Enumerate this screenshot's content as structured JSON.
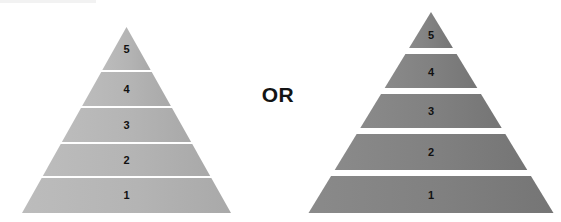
{
  "canvas": {
    "width": 561,
    "height": 222,
    "background": "#ffffff"
  },
  "connector": {
    "label": "OR",
    "color": "#141414"
  },
  "figures": [
    {
      "id": "pyramid-contiguous",
      "name": "left-pyramid",
      "style": "contiguous",
      "fill": "#b4b4b4",
      "fill_light": "#bcbcbc",
      "fill_dark": "#a9a9a9",
      "separator_color": "#ffffff",
      "separator_thickness": 2,
      "apex": {
        "x": 126.5,
        "y": 27
      },
      "base": {
        "left_x": 22,
        "right_x": 231,
        "y": 213
      },
      "tiers": [
        {
          "label": "5",
          "top_y": 27,
          "bottom_y": 70,
          "label_y": 50
        },
        {
          "label": "4",
          "top_y": 72,
          "bottom_y": 106,
          "label_y": 90
        },
        {
          "label": "3",
          "top_y": 108,
          "bottom_y": 142,
          "label_y": 126
        },
        {
          "label": "2",
          "top_y": 144,
          "bottom_y": 176,
          "label_y": 161
        },
        {
          "label": "1",
          "top_y": 178,
          "bottom_y": 213,
          "label_y": 196
        }
      ]
    },
    {
      "id": "pyramid-segmented",
      "name": "right-pyramid",
      "style": "segmented",
      "fill": "#808080",
      "fill_light": "#8a8a8a",
      "fill_dark": "#757575",
      "separator_color": "#ffffff",
      "gap": 6,
      "apex": {
        "x": 431,
        "y": 12
      },
      "base": {
        "left_x": 308,
        "right_x": 553,
        "y": 213
      },
      "tiers": [
        {
          "label": "5",
          "top_y": 12,
          "bottom_y": 48,
          "label_y": 36
        },
        {
          "label": "4",
          "top_y": 54,
          "bottom_y": 88,
          "label_y": 73
        },
        {
          "label": "3",
          "top_y": 94,
          "bottom_y": 128,
          "label_y": 112
        },
        {
          "label": "2",
          "top_y": 134,
          "bottom_y": 170,
          "label_y": 153
        },
        {
          "label": "1",
          "top_y": 176,
          "bottom_y": 213,
          "label_y": 196
        }
      ]
    }
  ],
  "chart_data": {
    "type": "diagram",
    "title": "",
    "subtitle": "",
    "comparison_operator": "OR",
    "options": [
      {
        "name": "left-pyramid",
        "style": "contiguous",
        "level_count": 5,
        "levels": [
          "5",
          "4",
          "3",
          "2",
          "1"
        ],
        "fill": "#b4b4b4",
        "divider": "thin white line",
        "divider_thickness_px": 2
      },
      {
        "name": "right-pyramid",
        "style": "segmented",
        "level_count": 5,
        "levels": [
          "5",
          "4",
          "3",
          "2",
          "1"
        ],
        "fill": "#808080",
        "divider": "white gap between separate bands",
        "divider_thickness_px": 6
      }
    ],
    "labels_top_to_bottom": [
      "5",
      "4",
      "3",
      "2",
      "1"
    ],
    "legend": [],
    "grid": false
  }
}
